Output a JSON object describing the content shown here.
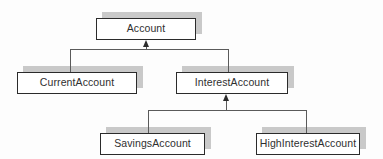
{
  "diagram": {
    "type": "uml-class-inheritance",
    "style": {
      "box_fill": "#ffffff",
      "box_border": "#2b2b2b",
      "shadow": "#c9c9c9",
      "connector": "#5a5a5a",
      "arrowhead": "#2b2b2b",
      "background": "#fdfdfd",
      "text": "#2f2f2f"
    },
    "classes": [
      {
        "id": "account",
        "label": "Account",
        "x": 96,
        "y": 18,
        "w": 100,
        "h": 22,
        "shadow_dx": 6,
        "shadow_dy": -6
      },
      {
        "id": "current_account",
        "label": "CurrentAccount",
        "x": 17,
        "y": 72,
        "w": 120,
        "h": 22,
        "shadow_dx": 6,
        "shadow_dy": -6
      },
      {
        "id": "interest_account",
        "label": "InterestAccount",
        "x": 176,
        "y": 72,
        "w": 112,
        "h": 22,
        "shadow_dx": 6,
        "shadow_dy": -6
      },
      {
        "id": "savings_account",
        "label": "SavingsAccount",
        "x": 100,
        "y": 133,
        "w": 105,
        "h": 22,
        "shadow_dx": 6,
        "shadow_dy": -6
      },
      {
        "id": "high_interest_account",
        "label": "HighInterestAccount",
        "x": 256,
        "y": 133,
        "w": 104,
        "h": 22,
        "shadow_dx": 6,
        "shadow_dy": -6
      }
    ],
    "generalizations": [
      {
        "id": "gen-account",
        "parent": "Account",
        "children": [
          "CurrentAccount",
          "InterestAccount"
        ],
        "arrow_x": 146,
        "arrow_tip_y": 40,
        "stem_bottom_y": 49,
        "bar_y": 49,
        "bar_left_x": 70,
        "bar_right_x": 228,
        "child_top_y": 72
      },
      {
        "id": "gen-interest-account",
        "parent": "InterestAccount",
        "children": [
          "SavingsAccount",
          "HighInterestAccount"
        ],
        "arrow_x": 226,
        "arrow_tip_y": 94,
        "stem_bottom_y": 110,
        "bar_y": 110,
        "bar_left_x": 148,
        "bar_right_x": 306,
        "child_top_y": 133
      }
    ]
  }
}
